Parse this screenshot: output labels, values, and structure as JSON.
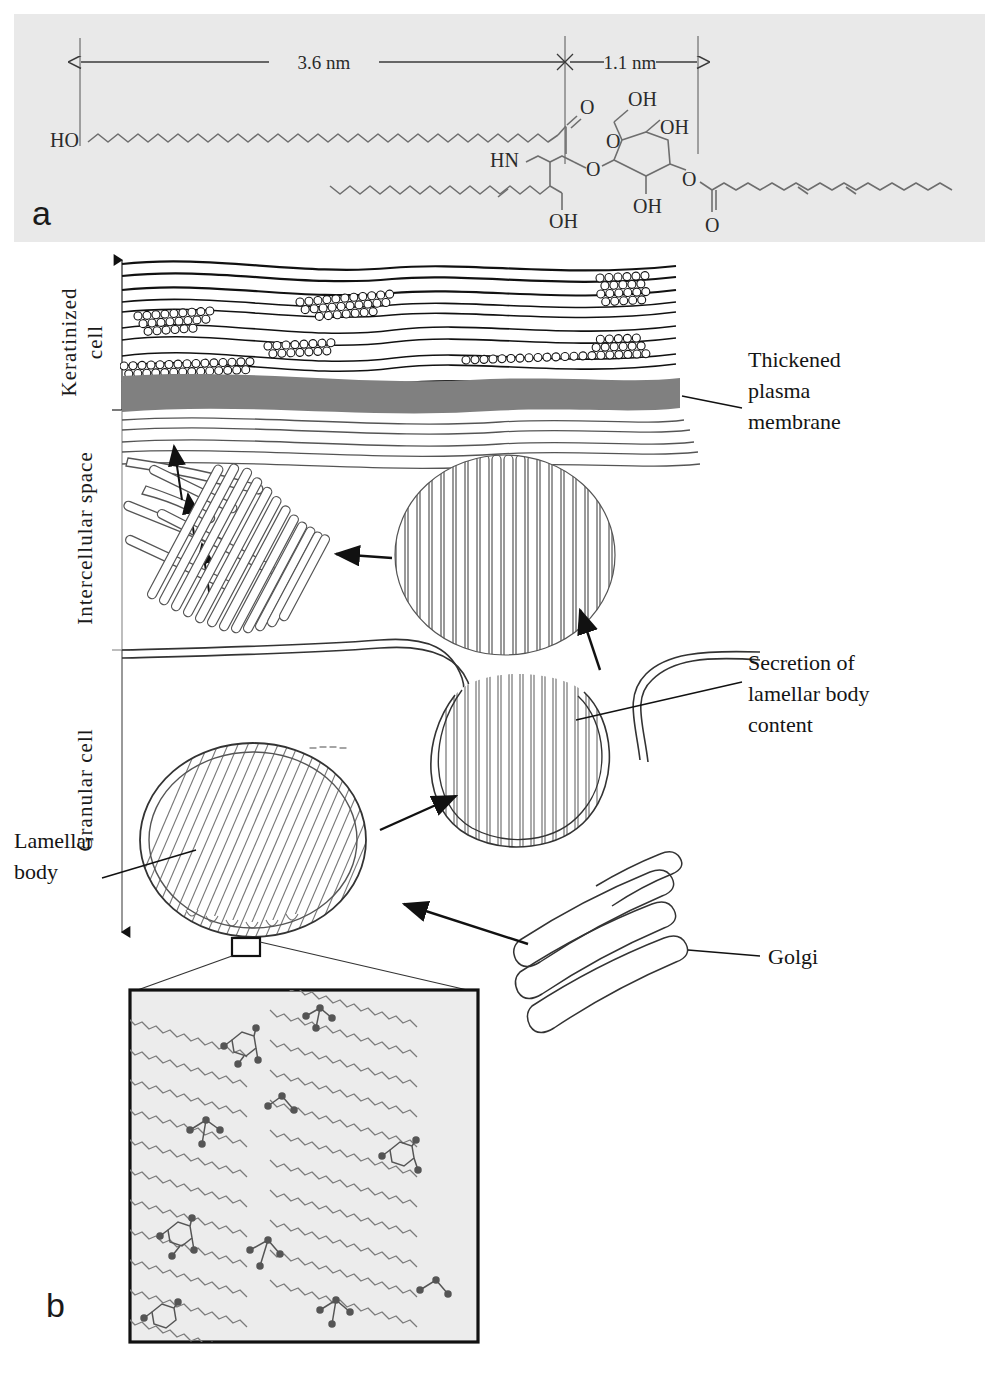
{
  "figure": {
    "panels": [
      {
        "id": "a",
        "label": "a",
        "kind": "chemical-structure",
        "description": "Molecular structure of a skin ceramide (acylglucosylceramide) with length annotations"
      },
      {
        "id": "b",
        "label": "b",
        "kind": "schematic-diagram",
        "description": "Schematic of lamellar body secretion and intercellular lipid lamellae in the epidermis, with magnified lipid packing inset"
      }
    ],
    "caption_partial": ""
  },
  "panel_a": {
    "label": "a",
    "dimensions": [
      {
        "name": "hydrophobic-span",
        "value": "3.6 nm"
      },
      {
        "name": "head-group-span",
        "value": "1.1 nm"
      }
    ],
    "atom_labels": [
      {
        "id": "terminal-hydroxyl",
        "text": "HO"
      },
      {
        "id": "amide-carbonyl-oxygen",
        "text": "O"
      },
      {
        "id": "amide-nitrogen",
        "text": "HN"
      },
      {
        "id": "sphingosine-hydroxyl",
        "text": "OH"
      },
      {
        "id": "sugar-hydroxyl-2",
        "text": "OH"
      },
      {
        "id": "sugar-hydroxyl-6",
        "text": "OH"
      },
      {
        "id": "sugar-hydroxyl-4",
        "text": "OH"
      },
      {
        "id": "glycosidic-oxygen",
        "text": "O"
      },
      {
        "id": "ring-oxygen",
        "text": "O"
      },
      {
        "id": "ester-oxygen",
        "text": "O"
      },
      {
        "id": "ester-carbonyl-oxygen",
        "text": "O"
      }
    ],
    "background_color": "#e9e9e9",
    "line_color": "#6b6b6b"
  },
  "panel_b": {
    "label": "b",
    "axis_labels": [
      {
        "id": "keratinized-cell",
        "text": "Keratinized\ncell",
        "line1": "Keratinized",
        "line2": "cell"
      },
      {
        "id": "intercellular-space",
        "text": "Intercellular space"
      },
      {
        "id": "granular-cell",
        "text": "Granular cell"
      }
    ],
    "callouts": [
      {
        "id": "thickened-plasma-membrane",
        "lines": [
          "Thickened",
          "plasma",
          "membrane"
        ]
      },
      {
        "id": "secretion-of-lamellar-body-content",
        "lines": [
          "Secretion of",
          "lamellar body",
          "content"
        ]
      },
      {
        "id": "lamellar-body",
        "lines": [
          "Lamellar",
          "body"
        ]
      },
      {
        "id": "golgi",
        "lines": [
          "Golgi"
        ]
      }
    ],
    "membrane_color": "#808080",
    "inset": {
      "id": "lipid-packing-inset",
      "background_color": "#ececec",
      "border_color": "#111111",
      "description": "Magnified view of ceramide chains packed in diagonal lamellae with sugar head groups"
    }
  }
}
